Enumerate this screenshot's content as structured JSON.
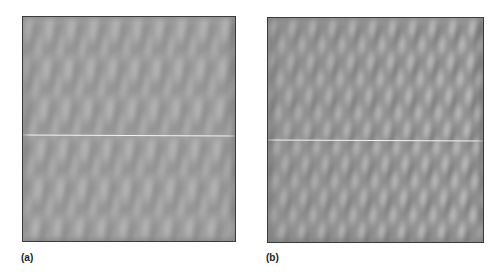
{
  "figure": {
    "panels": [
      {
        "id": "a",
        "label": "(a)",
        "description": "grayscale fabric-like texture with elongated vertical diamond patterns",
        "base_color": "#9a9a9a",
        "light_color": "#c8c8c8",
        "dark_color": "#6e6e6e",
        "scanline_y_pct": 52.5
      },
      {
        "id": "b",
        "label": "(b)",
        "description": "grayscale texture with elongated bright elliptical blobs, higher contrast on the right",
        "base_color": "#8f8f8f",
        "light_color": "#e0e0e0",
        "dark_color": "#5e5e5e",
        "scanline_y_pct": 54.5
      }
    ]
  }
}
